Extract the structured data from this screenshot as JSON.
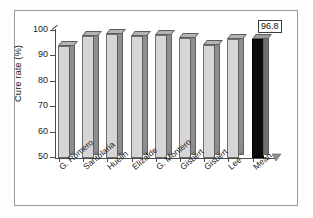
{
  "chart_data": {
    "type": "bar",
    "title": "",
    "xlabel": "",
    "ylabel": "Cure rate (%)",
    "ylim": [
      50,
      100
    ],
    "yticks": [
      50,
      60,
      70,
      80,
      90,
      100
    ],
    "grid": false,
    "legend": null,
    "categories": [
      "G. Romero",
      "Santolaria",
      "Huelin",
      "Elizalde",
      "G. Montero",
      "Gisbert",
      "Gisbert",
      "Lee",
      "Mean"
    ],
    "values": [
      94.0,
      98.0,
      98.8,
      98.2,
      98.3,
      97.4,
      94.5,
      96.8,
      96.8
    ],
    "annotations": [
      {
        "text": "96.8",
        "target": "Mean",
        "style": "boxed-label"
      }
    ],
    "series": [
      {
        "name": "Cure rate",
        "values": [
          94.0,
          98.0,
          98.8,
          98.2,
          98.3,
          97.4,
          94.5,
          96.8,
          96.8
        ]
      }
    ],
    "highlight_category": "Mean",
    "colors": {
      "bar_face": "#d6d6d6",
      "bar_side": "#8d8d8d",
      "bar_top": "#b4b4b4",
      "bar_edge": "#6e6e6e",
      "highlight_face": "#0b0b0b",
      "axis": "#4d4d4d",
      "text": "#1a1a1a",
      "frame": "#9a9a9a",
      "background": "#ffffff"
    }
  },
  "value_label": "96.8"
}
